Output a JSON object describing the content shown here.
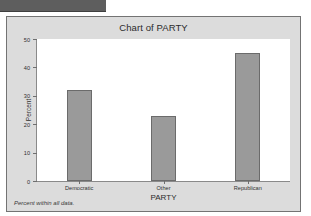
{
  "window": {
    "titlebar_strip": ""
  },
  "chart_panel": {
    "title": "Chart of PARTY",
    "footnote": "Percent within all data.",
    "frame_color": "#dcdcdc",
    "plot_background": "#ffffff",
    "bar_color": "#9a9a9a",
    "bar_border_color": "#6b6b6b",
    "axis_color": "#8a8a8a"
  },
  "chart_data": {
    "type": "bar",
    "title": "Chart of PARTY",
    "xlabel": "PARTY",
    "ylabel": "Percent",
    "categories": [
      "Democratic",
      "Other",
      "Republican"
    ],
    "values": [
      32,
      23,
      45
    ],
    "ylim": [
      0,
      50
    ],
    "yticks": [
      0,
      10,
      20,
      30,
      40,
      50
    ],
    "ytick_labels": [
      "0",
      "10",
      "20",
      "30",
      "40",
      "50"
    ],
    "grid": false,
    "legend": null,
    "annotation": "Percent within all data."
  }
}
